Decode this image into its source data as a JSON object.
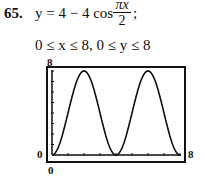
{
  "problem": {
    "number": "65.",
    "equation_prefix": "y = 4 − 4 cos",
    "fraction_numerator": "πx",
    "fraction_denominator": "2",
    "equation_suffix": ";",
    "window": "0 ≤ x ≤ 8, 0 ≤ y ≤ 8"
  },
  "axis_labels": {
    "ymax": "8",
    "ymin": "0",
    "xmin": "0",
    "xmax": "8"
  },
  "chart_data": {
    "type": "line",
    "xlabel": "",
    "ylabel": "",
    "xlim": [
      0,
      8
    ],
    "ylim": [
      0,
      8
    ],
    "x": [
      0,
      0.5,
      1,
      1.5,
      2,
      2.5,
      3,
      3.5,
      4,
      4.5,
      5,
      5.5,
      6,
      6.5,
      7,
      7.5,
      8
    ],
    "series": [
      {
        "name": "y = 4 − 4cos(πx/2)",
        "values": [
          0,
          1.17,
          4,
          6.83,
          8,
          6.83,
          4,
          1.17,
          0,
          1.17,
          4,
          6.83,
          8,
          6.83,
          4,
          1.17,
          0
        ]
      }
    ],
    "grid": false,
    "tick_marks": {
      "x": [
        1,
        2,
        3,
        4,
        5,
        6,
        7,
        8
      ],
      "y": [
        1,
        2,
        3,
        4,
        5,
        6,
        7,
        8
      ]
    }
  }
}
